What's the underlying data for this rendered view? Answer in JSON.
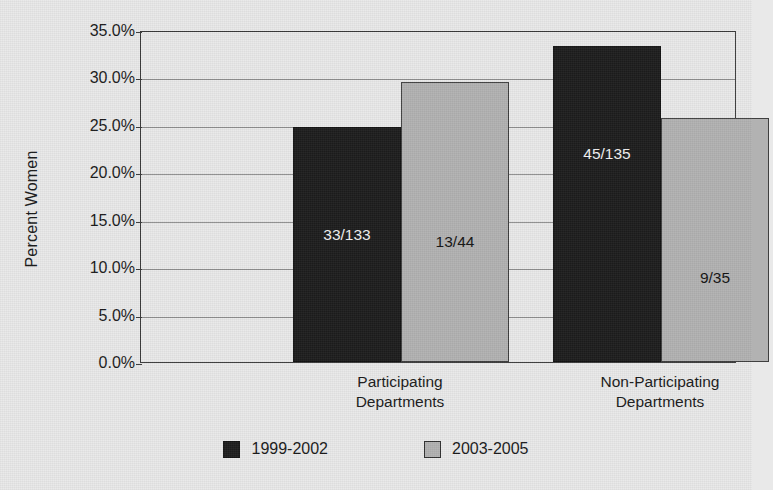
{
  "chart_data": {
    "type": "bar",
    "title": "",
    "xlabel": "",
    "ylabel": "Percent Women",
    "ylim": [
      0,
      35
    ],
    "ytick_step": 5,
    "grid": true,
    "legend_position": "bottom",
    "categories": [
      "Participating Departments",
      "Non-Participating Departments"
    ],
    "category_lines": [
      [
        "Participating",
        "Departments"
      ],
      [
        "Non-Participating",
        "Departments"
      ]
    ],
    "ytick_labels": [
      "35.0%",
      "30.0%",
      "25.0%",
      "20.0%",
      "15.0%",
      "10.0%",
      "5.0%",
      "0.0%"
    ],
    "ytick_values": [
      35,
      30,
      25,
      20,
      15,
      10,
      5,
      0
    ],
    "series": [
      {
        "name": "1999-2002",
        "color": "#1d1d1d",
        "values": [
          24.8,
          33.3
        ],
        "point_labels": [
          "33/133",
          "45/135"
        ],
        "numerators": [
          33,
          45
        ],
        "denominators": [
          133,
          135
        ]
      },
      {
        "name": "2003-2005",
        "color": "#b2b2b2",
        "values": [
          29.5,
          25.7
        ],
        "point_labels": [
          "13/44",
          "9/35"
        ],
        "numerators": [
          13,
          9
        ],
        "denominators": [
          44,
          35
        ]
      }
    ]
  },
  "axis": {
    "y_title": "Percent Women"
  },
  "legend": {
    "items": [
      {
        "label": "1999-2002",
        "swatch": "dark-swatch"
      },
      {
        "label": "2003-2005",
        "swatch": "light-swatch"
      }
    ]
  },
  "colors": {
    "series_1999_2002": "#1d1d1d",
    "series_2003_2005": "#b2b2b2",
    "background": "#e9e9e9",
    "frame": "#3a3a3a",
    "gridline": "#8e8e8e",
    "text": "#1a1a1a"
  }
}
